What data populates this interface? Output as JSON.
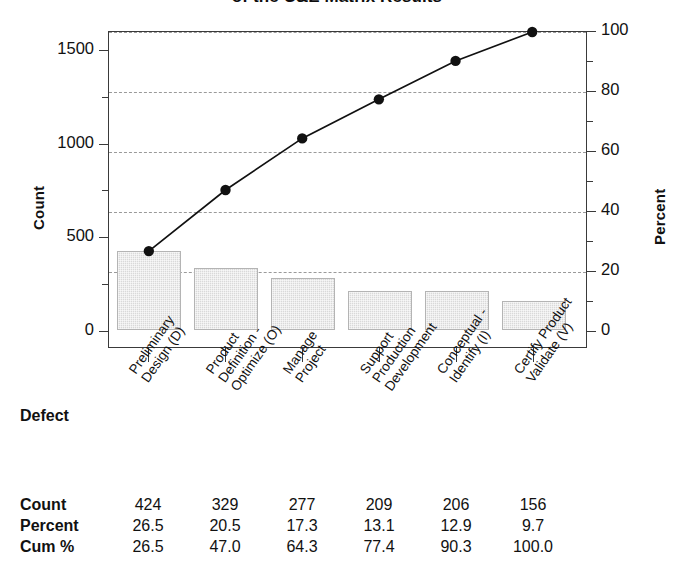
{
  "chart_data": {
    "type": "bar",
    "title": "of the C&E Matrix Results",
    "xlabel": "Defect",
    "ylabel": "Count",
    "y2label": "Percent",
    "ylim": [
      0,
      1600
    ],
    "y2lim": [
      0,
      100
    ],
    "grid": true,
    "legend": "none",
    "categories": [
      "Preliminary Design (D)",
      "Product Definition - Optimize (O)",
      "Manage Project",
      "Support Production Development",
      "Conceptual - Identify (I)",
      "Certify Product Validate (V)"
    ],
    "category_lines": [
      [
        "Preliminary",
        "Design (D)"
      ],
      [
        "Product",
        "Definition -",
        "Optimize (O)"
      ],
      [
        "Manage",
        "Project"
      ],
      [
        "Support",
        "Production",
        "Development"
      ],
      [
        "Conceptual -",
        "Identify (I)"
      ],
      [
        "Certify Product",
        "Validate (V)"
      ]
    ],
    "series": [
      {
        "name": "Count",
        "type": "bar",
        "values": [
          424,
          329,
          277,
          209,
          206,
          156
        ]
      },
      {
        "name": "Cum %",
        "type": "line",
        "values": [
          26.5,
          47.0,
          64.3,
          77.4,
          90.3,
          100.0
        ]
      }
    ],
    "percent": [
      26.5,
      20.5,
      17.3,
      13.1,
      12.9,
      9.7
    ],
    "yticks": [
      0,
      500,
      1000,
      1500
    ],
    "y2ticks": [
      0,
      20,
      40,
      60,
      80,
      100
    ],
    "gridline_percents": [
      20,
      40,
      60,
      80,
      100
    ],
    "bar_color": "#d9d9d9",
    "bar_edge_color": "#b4b4b4",
    "line_color": "#111111",
    "grid_color": "#9a9a9a",
    "frame_color": "#3a3a3a"
  },
  "axes": {
    "left_title": "Count",
    "right_title": "Percent",
    "left_ticks": [
      "1500",
      "1000",
      "500",
      "0"
    ],
    "right_ticks": [
      "100",
      "80",
      "60",
      "40",
      "20",
      "0"
    ]
  },
  "table": {
    "axis_label": "Defect",
    "rows": [
      {
        "label": "Count",
        "values": [
          "424",
          "329",
          "277",
          "209",
          "206",
          "156"
        ]
      },
      {
        "label": "Percent",
        "values": [
          "26.5",
          "20.5",
          "17.3",
          "13.1",
          "12.9",
          "9.7"
        ]
      },
      {
        "label": "Cum %",
        "values": [
          "26.5",
          "47.0",
          "64.3",
          "77.4",
          "90.3",
          "100.0"
        ]
      }
    ]
  }
}
